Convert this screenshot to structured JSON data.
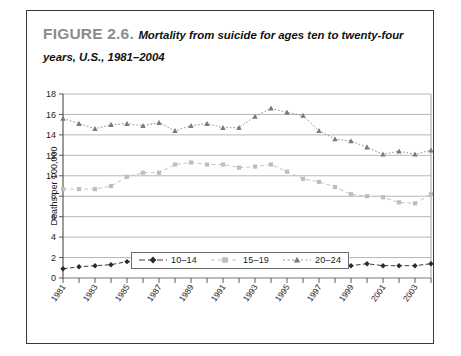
{
  "figure": {
    "label": "FIGURE 2.6.",
    "title": "Mortality from suicide for ages ten to twenty-four years, U.S., 1981–2004"
  },
  "colors": {
    "series_10_14": "#3d3d3d",
    "series_15_19": "#c3c3c3",
    "series_20_24": "#8f8f8f",
    "grid": "#9a9a9a",
    "axis": "#4a4a4a",
    "figure_label": "#8c8c8c",
    "border": "#3a3a3a"
  },
  "chart_data": {
    "type": "line",
    "title": "Mortality from suicide for ages ten to twenty-four years, U.S., 1981–2004",
    "xlabel": "",
    "ylabel": "Deaths per 100,000",
    "ylim": [
      0,
      18
    ],
    "ytick_step": 2,
    "yticks": [
      0,
      2,
      4,
      6,
      8,
      10,
      12,
      14,
      16,
      18
    ],
    "grid": true,
    "legend_position": "bottom-center",
    "x": [
      1981,
      1982,
      1983,
      1984,
      1985,
      1986,
      1987,
      1988,
      1989,
      1990,
      1991,
      1992,
      1993,
      1994,
      1995,
      1996,
      1997,
      1998,
      1999,
      2000,
      2001,
      2002,
      2003,
      2004
    ],
    "xtick_labels": [
      "1981",
      "1983",
      "1985",
      "1987",
      "1989",
      "1991",
      "1993",
      "1995",
      "1997",
      "1999",
      "2001",
      "2003"
    ],
    "series": [
      {
        "name": "10–14",
        "marker": "diamond",
        "color": "#3d3d3d",
        "values": [
          0.9,
          1.1,
          1.2,
          1.3,
          1.6,
          1.5,
          1.4,
          1.4,
          1.4,
          1.5,
          1.5,
          1.5,
          1.6,
          1.6,
          1.6,
          1.6,
          1.6,
          1.5,
          1.2,
          1.4,
          1.2,
          1.2,
          1.2,
          1.4
        ]
      },
      {
        "name": "15–19",
        "marker": "square",
        "color": "#c3c3c3",
        "values": [
          8.7,
          8.7,
          8.7,
          9.0,
          9.9,
          10.3,
          10.3,
          11.1,
          11.3,
          11.1,
          11.1,
          10.8,
          10.9,
          11.1,
          10.4,
          9.7,
          9.4,
          8.9,
          8.2,
          8.0,
          7.9,
          7.4,
          7.3,
          8.2
        ]
      },
      {
        "name": "20–24",
        "marker": "triangle",
        "color": "#8f8f8f",
        "values": [
          15.6,
          15.1,
          14.6,
          15.0,
          15.1,
          14.9,
          15.2,
          14.4,
          14.9,
          15.1,
          14.7,
          14.7,
          15.8,
          16.6,
          16.2,
          15.9,
          14.4,
          13.6,
          13.4,
          12.8,
          12.1,
          12.4,
          12.1,
          12.5
        ]
      }
    ]
  },
  "legend": {
    "items": [
      {
        "label": "10–14"
      },
      {
        "label": "15–19"
      },
      {
        "label": "20–24"
      }
    ]
  }
}
